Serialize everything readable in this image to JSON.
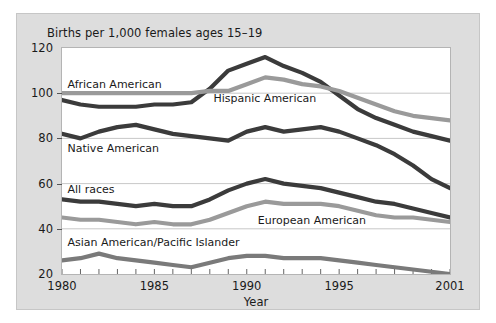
{
  "chart_data": {
    "type": "line",
    "title": "Births per 1,000 females ages 15–19",
    "xlabel": "Year",
    "ylabel": "",
    "xlim": [
      1980,
      2001
    ],
    "ylim": [
      20,
      120
    ],
    "grid": "horizontal",
    "legend_position": "inline-annotations",
    "ytick_labels": [
      "20",
      "40",
      "60",
      "80",
      "100",
      "120"
    ],
    "ytick_values": [
      20,
      40,
      60,
      80,
      100,
      120
    ],
    "xtick_labels": [
      "1980",
      "1985",
      "1990",
      "1995",
      "2001"
    ],
    "xtick_values": [
      1980,
      1985,
      1990,
      1995,
      2001
    ],
    "x": [
      1980,
      1981,
      1982,
      1983,
      1984,
      1985,
      1986,
      1987,
      1988,
      1989,
      1990,
      1991,
      1992,
      1993,
      1994,
      1995,
      1996,
      1997,
      1998,
      1999,
      2000,
      2001
    ],
    "series": [
      {
        "name": "African American",
        "color": "#3b3b3b",
        "values": [
          97,
          95,
          94,
          94,
          94,
          95,
          95,
          96,
          102,
          110,
          113,
          116,
          112,
          109,
          105,
          99,
          93,
          89,
          86,
          83,
          81,
          79
        ]
      },
      {
        "name": "Hispanic American",
        "color": "#9a9a9a",
        "values": [
          100,
          100,
          100,
          100,
          100,
          100,
          100,
          100,
          101,
          101,
          104,
          107,
          106,
          104,
          103,
          101,
          98,
          95,
          92,
          90,
          89,
          88
        ]
      },
      {
        "name": "Native American",
        "color": "#3b3b3b",
        "values": [
          82,
          80,
          83,
          85,
          86,
          84,
          82,
          81,
          80,
          79,
          83,
          85,
          83,
          84,
          85,
          83,
          80,
          77,
          73,
          68,
          62,
          58
        ]
      },
      {
        "name": "All races",
        "color": "#3b3b3b",
        "values": [
          53,
          52,
          52,
          51,
          50,
          51,
          50,
          50,
          53,
          57,
          60,
          62,
          60,
          59,
          58,
          56,
          54,
          52,
          51,
          49,
          47,
          45
        ]
      },
      {
        "name": "European American",
        "color": "#9a9a9a",
        "values": [
          45,
          44,
          44,
          43,
          42,
          43,
          42,
          42,
          44,
          47,
          50,
          52,
          51,
          51,
          51,
          50,
          48,
          46,
          45,
          45,
          44,
          43
        ]
      },
      {
        "name": "Asian American/Pacific Islander",
        "color": "#7a7a7a",
        "values": [
          26,
          27,
          29,
          27,
          26,
          25,
          24,
          23,
          25,
          27,
          28,
          28,
          27,
          27,
          27,
          26,
          25,
          24,
          23,
          22,
          21,
          20
        ]
      }
    ],
    "annotations": [
      {
        "text": "African American",
        "x": 1980.3,
        "y": 103.5
      },
      {
        "text": "Hispanic American",
        "x": 1988.2,
        "y": 97.5
      },
      {
        "text": "Native American",
        "x": 1980.3,
        "y": 75.5
      },
      {
        "text": "All races",
        "x": 1980.3,
        "y": 57.0
      },
      {
        "text": "European American",
        "x": 1990.6,
        "y": 43.5
      },
      {
        "text": "Asian American/Pacific Islander",
        "x": 1980.3,
        "y": 33.5
      }
    ]
  }
}
